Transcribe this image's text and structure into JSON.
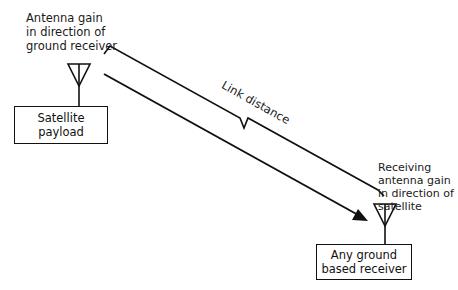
{
  "diagram": {
    "satellite_antenna_label": [
      "Antenna gain",
      "in direction of",
      "ground receiver"
    ],
    "satellite_box": [
      "Satellite",
      "payload"
    ],
    "link_label": "Link distance",
    "receiver_antenna_label": [
      "Receiving",
      "antenna gain",
      "in direction of",
      "satellite"
    ],
    "receiver_box": [
      "Any ground",
      "based receiver"
    ],
    "colors": {
      "line": "#111111",
      "background": "#ffffff"
    }
  }
}
